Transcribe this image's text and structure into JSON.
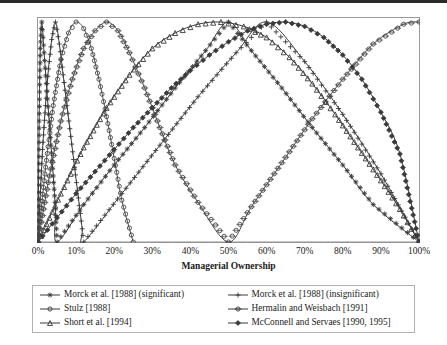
{
  "chart_data": {
    "type": "line",
    "title": "",
    "xlabel": "Managerial Ownership",
    "ylabel": "Performance",
    "xlim": [
      0,
      100
    ],
    "ylim": [
      0,
      1
    ],
    "grid": false,
    "legend_position": "bottom",
    "xticks": [
      "0%",
      "10%",
      "20%",
      "30%",
      "40%",
      "50%",
      "60%",
      "70%",
      "80%",
      "90%",
      "100%"
    ],
    "xtick_values": [
      0,
      10,
      20,
      30,
      40,
      50,
      60,
      70,
      80,
      90,
      100
    ],
    "yticks": [],
    "series": [
      {
        "name": "Morck et al. [1988] (significant)",
        "marker": "star",
        "color": "#3a3a3a",
        "points": [
          [
            0,
            0.0
          ],
          [
            0.3,
            0.55
          ],
          [
            0.6,
            0.88
          ],
          [
            1.0,
            1.0
          ],
          [
            1.6,
            0.86
          ],
          [
            2.2,
            0.72
          ],
          [
            2.8,
            0.58
          ],
          [
            3.4,
            0.44
          ],
          [
            4.0,
            0.3
          ],
          [
            4.6,
            0.15
          ],
          [
            5.0,
            0.0
          ],
          [
            12,
            0.17
          ],
          [
            20,
            0.35
          ],
          [
            28,
            0.52
          ],
          [
            36,
            0.7
          ],
          [
            44,
            0.87
          ],
          [
            50,
            1.0
          ],
          [
            56,
            0.87
          ],
          [
            64,
            0.7
          ],
          [
            72,
            0.52
          ],
          [
            80,
            0.35
          ],
          [
            88,
            0.17
          ],
          [
            100,
            0.0
          ]
        ]
      },
      {
        "name": "Morck et al. [1988] (insignificant)",
        "marker": "plus",
        "color": "#3a3a3a",
        "points": [
          [
            0,
            0.0
          ],
          [
            1.2,
            0.42
          ],
          [
            2.4,
            0.72
          ],
          [
            3.6,
            0.92
          ],
          [
            4.6,
            1.0
          ],
          [
            5.6,
            0.9
          ],
          [
            6.6,
            0.76
          ],
          [
            7.6,
            0.62
          ],
          [
            8.6,
            0.48
          ],
          [
            9.6,
            0.34
          ],
          [
            10.6,
            0.2
          ],
          [
            11.6,
            0.06
          ],
          [
            12.0,
            0.0
          ],
          [
            22,
            0.22
          ],
          [
            32,
            0.44
          ],
          [
            42,
            0.66
          ],
          [
            52,
            0.86
          ],
          [
            60,
            1.0
          ],
          [
            70,
            0.82
          ],
          [
            80,
            0.58
          ],
          [
            90,
            0.31
          ],
          [
            100,
            0.0
          ]
        ]
      },
      {
        "name": "Stulz [1988]",
        "marker": "circle",
        "color": "#4a4a4a",
        "points": [
          [
            0,
            0.0
          ],
          [
            2,
            0.34
          ],
          [
            4,
            0.62
          ],
          [
            6,
            0.83
          ],
          [
            8,
            0.95
          ],
          [
            10,
            1.0
          ],
          [
            12,
            0.97
          ],
          [
            14,
            0.88
          ],
          [
            16,
            0.74
          ],
          [
            18,
            0.57
          ],
          [
            20,
            0.38
          ],
          [
            22,
            0.19
          ],
          [
            25,
            0.0
          ]
        ]
      },
      {
        "name": "Hermalin and Weisbach [1991]",
        "marker": "circle-open",
        "color": "#4a4a4a",
        "points": [
          [
            0,
            0.0
          ],
          [
            3,
            0.3
          ],
          [
            6,
            0.55
          ],
          [
            9,
            0.74
          ],
          [
            12,
            0.88
          ],
          [
            15,
            0.96
          ],
          [
            18,
            1.0
          ],
          [
            21,
            0.96
          ],
          [
            24,
            0.86
          ],
          [
            28,
            0.7
          ],
          [
            32,
            0.52
          ],
          [
            36,
            0.35
          ],
          [
            42,
            0.18
          ],
          [
            50,
            0.0
          ],
          [
            56,
            0.16
          ],
          [
            64,
            0.36
          ],
          [
            72,
            0.56
          ],
          [
            80,
            0.74
          ],
          [
            88,
            0.9
          ],
          [
            96,
            0.99
          ],
          [
            100,
            1.0
          ]
        ]
      },
      {
        "name": "Short et al. [1994]",
        "marker": "triangle",
        "color": "#3a3a3a",
        "points": [
          [
            0,
            0.0
          ],
          [
            6,
            0.22
          ],
          [
            12,
            0.43
          ],
          [
            18,
            0.61
          ],
          [
            24,
            0.76
          ],
          [
            30,
            0.88
          ],
          [
            36,
            0.95
          ],
          [
            42,
            0.99
          ],
          [
            48,
            1.0
          ],
          [
            54,
            0.98
          ],
          [
            60,
            0.93
          ],
          [
            66,
            0.84
          ],
          [
            72,
            0.72
          ],
          [
            78,
            0.58
          ],
          [
            84,
            0.43
          ],
          [
            90,
            0.28
          ],
          [
            95,
            0.15
          ],
          [
            100,
            0.0
          ]
        ]
      },
      {
        "name": "McConnell and Servaes [1990, 1995]",
        "marker": "diamond",
        "color": "#3a3a3a",
        "points": [
          [
            0,
            0.0
          ],
          [
            5,
            0.11
          ],
          [
            10,
            0.22
          ],
          [
            15,
            0.32
          ],
          [
            20,
            0.42
          ],
          [
            25,
            0.52
          ],
          [
            30,
            0.61
          ],
          [
            35,
            0.7
          ],
          [
            40,
            0.78
          ],
          [
            45,
            0.85
          ],
          [
            50,
            0.91
          ],
          [
            55,
            0.96
          ],
          [
            60,
            0.99
          ],
          [
            65,
            1.0
          ],
          [
            70,
            0.98
          ],
          [
            75,
            0.93
          ],
          [
            80,
            0.85
          ],
          [
            85,
            0.74
          ],
          [
            90,
            0.59
          ],
          [
            95,
            0.4
          ],
          [
            100,
            0.0
          ]
        ]
      }
    ]
  },
  "legend": {
    "items": [
      {
        "label": "Morck et al. [1988] (significant)",
        "marker": "star"
      },
      {
        "label": "Morck et al. [1988] (insignificant)",
        "marker": "plus"
      },
      {
        "label": "Stulz [1988]",
        "marker": "circle"
      },
      {
        "label": "Hermalin and Weisbach [1991]",
        "marker": "circle-open"
      },
      {
        "label": "Short et al. [1994]",
        "marker": "triangle"
      },
      {
        "label": "McConnell and Servaes [1990, 1995]",
        "marker": "diamond"
      }
    ]
  },
  "colors": {
    "line": "#3a3a3a",
    "line_light": "#6e6e6e",
    "frame": "#9a9a9a",
    "text": "#1a1a1a"
  }
}
